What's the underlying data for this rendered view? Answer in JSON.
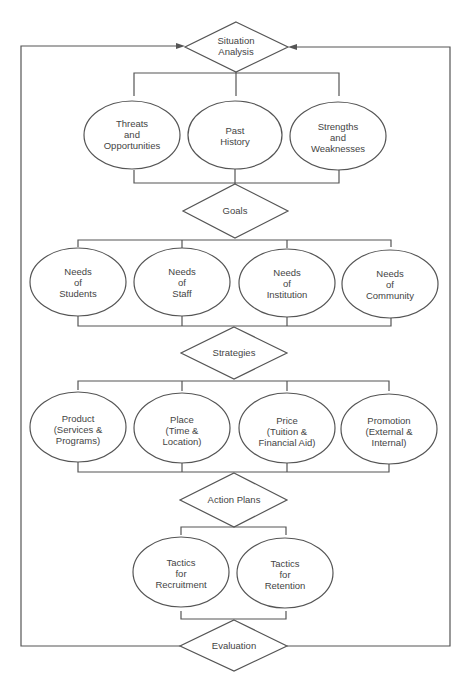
{
  "diagram": {
    "type": "flowchart",
    "nodes": {
      "situation": {
        "shape": "diamond",
        "lines": [
          "Situation",
          "Analysis"
        ]
      },
      "threats": {
        "shape": "ellipse",
        "lines": [
          "Threats",
          "and",
          "Opportunities"
        ]
      },
      "past": {
        "shape": "ellipse",
        "lines": [
          "Past",
          "History"
        ]
      },
      "strengths": {
        "shape": "ellipse",
        "lines": [
          "Strengths",
          "and",
          "Weaknesses"
        ]
      },
      "goals": {
        "shape": "diamond",
        "lines": [
          "Goals"
        ]
      },
      "students": {
        "shape": "ellipse",
        "lines": [
          "Needs",
          "of",
          "Students"
        ]
      },
      "staff": {
        "shape": "ellipse",
        "lines": [
          "Needs",
          "of",
          "Staff"
        ]
      },
      "institution": {
        "shape": "ellipse",
        "lines": [
          "Needs",
          "of",
          "Institution"
        ]
      },
      "community": {
        "shape": "ellipse",
        "lines": [
          "Needs",
          "of",
          "Community"
        ]
      },
      "strategies": {
        "shape": "diamond",
        "lines": [
          "Strategies"
        ]
      },
      "product": {
        "shape": "ellipse",
        "lines": [
          "Product",
          "(Services &",
          "Programs)"
        ]
      },
      "place": {
        "shape": "ellipse",
        "lines": [
          "Place",
          "(Time &",
          "Location)"
        ]
      },
      "price": {
        "shape": "ellipse",
        "lines": [
          "Price",
          "(Tuition &",
          "Financial Aid)"
        ]
      },
      "promotion": {
        "shape": "ellipse",
        "lines": [
          "Promotion",
          "(External &",
          "Internal)"
        ]
      },
      "action": {
        "shape": "diamond",
        "lines": [
          "Action Plans"
        ]
      },
      "recruitment": {
        "shape": "ellipse",
        "lines": [
          "Tactics",
          "for",
          "Recruitment"
        ]
      },
      "retention": {
        "shape": "ellipse",
        "lines": [
          "Tactics",
          "for",
          "Retention"
        ]
      },
      "evaluation": {
        "shape": "diamond",
        "lines": [
          "Evaluation"
        ]
      }
    },
    "edges": [
      [
        "situation",
        "threats"
      ],
      [
        "situation",
        "past"
      ],
      [
        "situation",
        "strengths"
      ],
      [
        "threats",
        "goals"
      ],
      [
        "past",
        "goals"
      ],
      [
        "strengths",
        "goals"
      ],
      [
        "goals",
        "students"
      ],
      [
        "goals",
        "staff"
      ],
      [
        "goals",
        "institution"
      ],
      [
        "goals",
        "community"
      ],
      [
        "students",
        "strategies"
      ],
      [
        "staff",
        "strategies"
      ],
      [
        "institution",
        "strategies"
      ],
      [
        "community",
        "strategies"
      ],
      [
        "strategies",
        "product"
      ],
      [
        "strategies",
        "place"
      ],
      [
        "strategies",
        "price"
      ],
      [
        "strategies",
        "promotion"
      ],
      [
        "product",
        "action"
      ],
      [
        "place",
        "action"
      ],
      [
        "price",
        "action"
      ],
      [
        "promotion",
        "action"
      ],
      [
        "action",
        "recruitment"
      ],
      [
        "action",
        "retention"
      ],
      [
        "recruitment",
        "evaluation"
      ],
      [
        "retention",
        "evaluation"
      ],
      [
        "evaluation",
        "situation",
        "feedback-left"
      ],
      [
        "evaluation",
        "situation",
        "feedback-right"
      ]
    ]
  }
}
